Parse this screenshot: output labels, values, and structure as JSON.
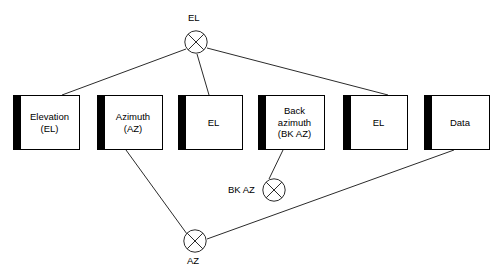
{
  "diagram": {
    "type": "surveying-traverse-flow-diagram",
    "canvas": {
      "width": 501,
      "height": 276
    },
    "boxes": [
      {
        "id": "elevation",
        "label": "Elevation\n(EL)",
        "x": 13,
        "y": 95,
        "w": 67,
        "h": 55
      },
      {
        "id": "azimuth",
        "label": "Azimuth\n(AZ)",
        "x": 97,
        "y": 95,
        "w": 66,
        "h": 55
      },
      {
        "id": "el-2",
        "label": "EL",
        "x": 178,
        "y": 95,
        "w": 65,
        "h": 55
      },
      {
        "id": "back-azimuth",
        "label": "Back\nazimuth\n(BK AZ)",
        "x": 258,
        "y": 95,
        "w": 67,
        "h": 55
      },
      {
        "id": "el-3",
        "label": "EL",
        "x": 343,
        "y": 95,
        "w": 65,
        "h": 55
      },
      {
        "id": "data",
        "label": "Data",
        "x": 424,
        "y": 95,
        "w": 66,
        "h": 55
      }
    ],
    "junctions": [
      {
        "id": "el-junction",
        "label": "EL",
        "cx": 196,
        "cy": 42,
        "r": 12,
        "label_x": 188,
        "label_y": 12
      },
      {
        "id": "bk-az-junction",
        "label": "BK AZ",
        "cx": 274,
        "cy": 190,
        "r": 12,
        "label_x": 228,
        "label_y": 184
      },
      {
        "id": "az-junction",
        "label": "AZ",
        "cx": 195,
        "cy": 241,
        "r": 12,
        "label_x": 187,
        "label_y": 255
      }
    ],
    "edges": [
      {
        "id": "el-to-elevation",
        "from": "el-junction",
        "to": "elevation",
        "x1": 186,
        "y1": 49,
        "x2": 62,
        "y2": 95
      },
      {
        "id": "el-to-el2",
        "from": "el-junction",
        "to": "el-2",
        "x1": 197,
        "y1": 54,
        "x2": 209,
        "y2": 95
      },
      {
        "id": "el-to-el3",
        "from": "el-junction",
        "to": "el-3",
        "x1": 207,
        "y1": 48,
        "x2": 388,
        "y2": 95
      },
      {
        "id": "azimuth-to-az",
        "from": "azimuth",
        "to": "az-junction",
        "x1": 126,
        "y1": 150,
        "x2": 187,
        "y2": 234
      },
      {
        "id": "backaz-to-bkaz",
        "from": "back-azimuth",
        "to": "bk-az-junction",
        "x1": 283,
        "y1": 150,
        "x2": 269,
        "y2": 179
      },
      {
        "id": "data-to-az",
        "from": "data",
        "to": "az-junction",
        "x1": 454,
        "y1": 150,
        "x2": 207,
        "y2": 239
      }
    ],
    "style": {
      "line_color": "#2b2b2b",
      "box_border_color": "#000000",
      "tab_color": "#000000",
      "background": "#ffffff",
      "text_color": "#000000"
    }
  }
}
